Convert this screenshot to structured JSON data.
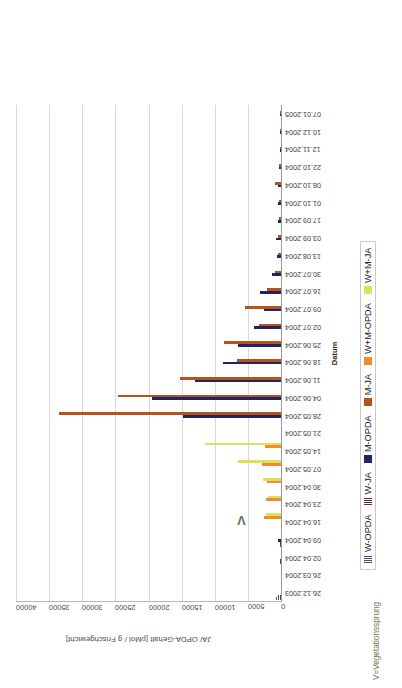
{
  "chart_data": {
    "type": "bar",
    "title": "",
    "xlabel": "Datum",
    "ylabel": "JA/ OPDA-Gehalt [pMol / g Frischgewicht]",
    "ylim": [
      0,
      40000
    ],
    "yticks": [
      0,
      5000,
      10000,
      15000,
      20000,
      25000,
      30000,
      35000,
      40000
    ],
    "grid": true,
    "legend_position": "bottom",
    "orientation": "vertical-bars",
    "categories": [
      "26.12.2003",
      "26.03.2004",
      "02.04.2004",
      "09.04.2004",
      "16.04.2004",
      "23.04.2004",
      "30.04.2004",
      "07.05.2004",
      "14.05.2004",
      "21.05.2004",
      "28.05.2004",
      "04.06.2004",
      "11.06.2004",
      "18.06.2004",
      "25.06.2004",
      "02.07.2004",
      "09.07.2004",
      "16.07.2004",
      "30.07.2004",
      "13.08.2004",
      "03.09.2004",
      "17.09.2004",
      "01.10.2004",
      "08.10.2004",
      "22.10.2004",
      "12.11.2004",
      "10.12.2004",
      "07.01.2005"
    ],
    "series": [
      {
        "name": "W-OPDA",
        "color": "#8d8dc0",
        "pattern": "striped",
        "values": [
          700,
          0,
          350,
          300,
          0,
          0,
          0,
          0,
          0,
          0,
          0,
          0,
          0,
          0,
          0,
          0,
          0,
          0,
          0,
          0,
          0,
          0,
          0,
          0,
          0,
          0,
          0,
          0
        ]
      },
      {
        "name": "W-JA",
        "color": "#9b6b73",
        "pattern": "striped",
        "values": [
          400,
          0,
          200,
          200,
          0,
          0,
          0,
          0,
          0,
          0,
          0,
          0,
          0,
          0,
          0,
          0,
          0,
          0,
          0,
          0,
          0,
          0,
          0,
          0,
          0,
          0,
          0,
          0
        ]
      },
      {
        "name": "M-OPDA",
        "color": "#1f2463",
        "pattern": "solid",
        "values": [
          0,
          0,
          0,
          500,
          0,
          0,
          0,
          0,
          0,
          0,
          14800,
          19500,
          13000,
          8700,
          6500,
          4100,
          2600,
          3200,
          1300,
          600,
          700,
          400,
          400,
          500,
          300,
          200,
          150,
          120
        ]
      },
      {
        "name": "M-JA",
        "color": "#b8521c",
        "pattern": "solid",
        "values": [
          0,
          0,
          0,
          0,
          0,
          0,
          0,
          0,
          0,
          0,
          33500,
          24600,
          15200,
          6700,
          8600,
          3300,
          5400,
          2100,
          900,
          500,
          450,
          350,
          300,
          900,
          250,
          200,
          120,
          100
        ]
      },
      {
        "name": "W+M-OPDA",
        "color": "#ef8b33",
        "pattern": "solid",
        "values": [
          0,
          0,
          0,
          0,
          2600,
          2200,
          2100,
          2900,
          2400,
          0,
          0,
          0,
          0,
          0,
          0,
          0,
          0,
          0,
          0,
          0,
          0,
          0,
          0,
          0,
          0,
          0,
          0,
          0
        ]
      },
      {
        "name": "W+M-JA",
        "color": "#d9e25a",
        "pattern": "solid",
        "values": [
          0,
          0,
          0,
          0,
          2300,
          1900,
          2700,
          6500,
          11500,
          0,
          0,
          0,
          0,
          0,
          0,
          0,
          0,
          0,
          0,
          0,
          0,
          0,
          0,
          0,
          0,
          0,
          0,
          0
        ]
      }
    ],
    "annotations": [
      {
        "name": "vegetation-jump-marker",
        "text": "V",
        "category": "16.04.2004",
        "note": "V=Vegetationssprung"
      }
    ],
    "footnote": "V=Vegetationssprung"
  }
}
